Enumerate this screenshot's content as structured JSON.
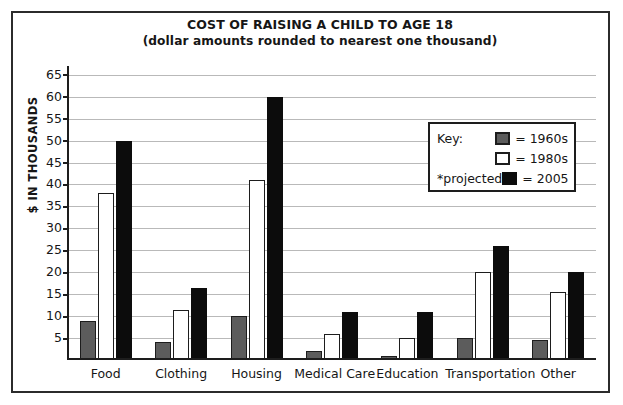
{
  "chart_data": {
    "type": "bar",
    "title": "COST OF RAISING A CHILD TO AGE 18",
    "subtitle": "(dollar amounts rounded to nearest one thousand)",
    "xlabel": "",
    "ylabel": "$ IN THOUSANDS",
    "ylim": [
      0,
      67
    ],
    "yticks": [
      5,
      10,
      15,
      20,
      25,
      30,
      35,
      40,
      45,
      50,
      55,
      60,
      65
    ],
    "ytick_labels": [
      "5",
      "10",
      "15",
      "20",
      "25",
      "30",
      "35",
      "40",
      "45",
      "50",
      "55",
      "60",
      "65"
    ],
    "grid": true,
    "legend_position": "inside-upper-right",
    "categories": [
      "Food",
      "Clothing",
      "Housing",
      "Medical Care",
      "Education",
      "Transportation",
      "Other"
    ],
    "series": [
      {
        "name": "1960s",
        "color": "#5c5c5c",
        "values": [
          9,
          4,
          10,
          2,
          1,
          5,
          4.5
        ]
      },
      {
        "name": "1980s",
        "color": "#ffffff",
        "values": [
          38,
          11.5,
          41,
          6,
          5,
          20,
          15.5
        ]
      },
      {
        "name": "2005",
        "color": "#0c0c0c",
        "values": [
          50,
          16.5,
          60,
          11,
          11,
          26,
          20
        ]
      }
    ],
    "annotations": [
      "*projected"
    ]
  },
  "legend": {
    "key_label": "Key:",
    "projected_note": "*projected",
    "equals": "=",
    "entries": [
      {
        "label": "1960s",
        "swatch": "gray-swatch"
      },
      {
        "label": "1980s",
        "swatch": "white-swatch"
      },
      {
        "label": "2005",
        "swatch": "black-swatch"
      }
    ]
  },
  "colors": {
    "series_1960s": "#5c5c5c",
    "series_1980s": "#ffffff",
    "series_2005": "#0c0c0c",
    "axis": "#1d1d1d",
    "gridline": "#b9b9b9",
    "text": "#161616"
  }
}
